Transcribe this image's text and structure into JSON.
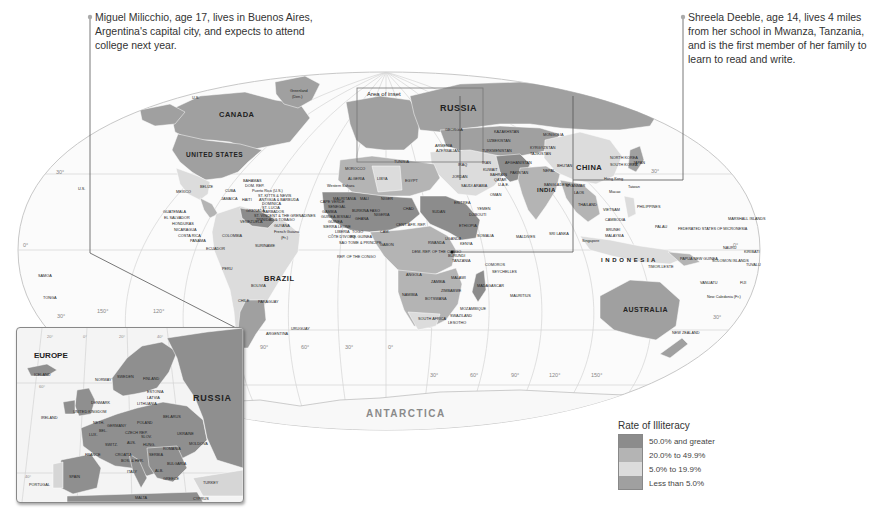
{
  "callouts": [
    {
      "id": "miguel",
      "text_lines": [
        "Miguel Milicchio, age 17, lives in Buenos Aires,",
        "Argentina's capital city, and expects to attend",
        "college next year."
      ]
    },
    {
      "id": "shreela",
      "text_lines": [
        "Shreela Deeble, age 14, lives 4 miles",
        "from her school in Mwanza, Tanzania,",
        "and is the first member of her family to",
        "learn to read and write."
      ]
    }
  ],
  "legend": {
    "title": "Rate of Illiteracy",
    "items": [
      {
        "label": "50.0% and greater",
        "color": "#8c8c8c"
      },
      {
        "label": "20.0% to 49.9%",
        "color": "#b4b4b4"
      },
      {
        "label": "5.0% to 19.9%",
        "color": "#dcdcdc"
      },
      {
        "label": "Less than 5.0%",
        "color": "#a0a0a0"
      }
    ]
  },
  "inset": {
    "title": "EUROPE",
    "russia_label": "RUSSIA",
    "area_of_inset_label": "Area of inset",
    "countries": [
      "ICELAND",
      "NORWAY",
      "SWEDEN",
      "FINLAND",
      "ESTONIA",
      "LATVIA",
      "LITHUANIA",
      "DENMARK",
      "UNITED KINGDOM",
      "IRELAND",
      "NETH.",
      "BEL.",
      "LUX.",
      "GERMANY",
      "POLAND",
      "BELARUS",
      "UKRAINE",
      "MOLDOVA",
      "CZECH REP.",
      "SLOV.",
      "AUS.",
      "HUNG.",
      "ROMANIA",
      "SWITZ.",
      "FRANCE",
      "CROATIA",
      "BOS. & HER.",
      "SERBIA",
      "BULGARIA",
      "ALB.",
      "GREECE",
      "ITALY",
      "SPAIN",
      "PORTUGAL",
      "TURKEY",
      "MALTA",
      "CYPRUS"
    ],
    "grid_labels": [
      "20°",
      "0°",
      "20°",
      "40°",
      "60°",
      "40°"
    ]
  },
  "map": {
    "big_labels": {
      "russia": "RUSSIA",
      "canada": "CANADA",
      "us": "UNITED STATES",
      "brazil": "BRAZIL",
      "china": "CHINA",
      "india": "INDIA",
      "australia": "AUSTRALIA",
      "indonesia": "I N D O N E S I A",
      "antarctica": "ANTARCTICA"
    },
    "labels": [
      {
        "t": "Greenland",
        "x": 290,
        "y": 92
      },
      {
        "t": "(Den.)",
        "x": 292,
        "y": 98
      },
      {
        "t": "U.S.",
        "x": 192,
        "y": 99
      },
      {
        "t": "MEXICO",
        "x": 176,
        "y": 193
      },
      {
        "t": "BELIZE",
        "x": 200,
        "y": 188
      },
      {
        "t": "CUBA",
        "x": 225,
        "y": 192
      },
      {
        "t": "BAHAMAS",
        "x": 243,
        "y": 182
      },
      {
        "t": "DOM. REP.",
        "x": 245,
        "y": 187
      },
      {
        "t": "Puerto Rico (U.S.)",
        "x": 252,
        "y": 192
      },
      {
        "t": "ST. KITTS & NEVIS",
        "x": 258,
        "y": 197
      },
      {
        "t": "ANTIGUA & BARBUDA",
        "x": 259,
        "y": 201
      },
      {
        "t": "DOMINICA",
        "x": 262,
        "y": 205
      },
      {
        "t": "ST. LUCIA",
        "x": 262,
        "y": 209
      },
      {
        "t": "BARBADOS",
        "x": 263,
        "y": 213
      },
      {
        "t": "ST. VINCENT & THE GRENADINES",
        "x": 254,
        "y": 217
      },
      {
        "t": "TRINIDAD & TOBAGO",
        "x": 256,
        "y": 221
      },
      {
        "t": "GRENADA",
        "x": 246,
        "y": 212
      },
      {
        "t": "JAMAICA",
        "x": 221,
        "y": 200
      },
      {
        "t": "HAITI",
        "x": 242,
        "y": 201
      },
      {
        "t": "GUATEMALA",
        "x": 163,
        "y": 213
      },
      {
        "t": "EL SALVADOR",
        "x": 164,
        "y": 219
      },
      {
        "t": "HONDURAS",
        "x": 172,
        "y": 225
      },
      {
        "t": "NICARAGUA",
        "x": 174,
        "y": 231
      },
      {
        "t": "COSTA RICA",
        "x": 178,
        "y": 237
      },
      {
        "t": "PANAMA",
        "x": 190,
        "y": 242
      },
      {
        "t": "ECUADOR",
        "x": 206,
        "y": 250
      },
      {
        "t": "COLOMBIA",
        "x": 222,
        "y": 237
      },
      {
        "t": "VENEZUELA",
        "x": 240,
        "y": 223
      },
      {
        "t": "GUYANA",
        "x": 274,
        "y": 227
      },
      {
        "t": "SURINAME",
        "x": 255,
        "y": 247
      },
      {
        "t": "French Guiana",
        "x": 274,
        "y": 233
      },
      {
        "t": "(Fr.)",
        "x": 281,
        "y": 239
      },
      {
        "t": "PERU",
        "x": 222,
        "y": 270
      },
      {
        "t": "BOLIVIA",
        "x": 251,
        "y": 287
      },
      {
        "t": "CHILE",
        "x": 238,
        "y": 302
      },
      {
        "t": "PARAGUAY",
        "x": 258,
        "y": 303
      },
      {
        "t": "URUGUAY",
        "x": 291,
        "y": 330
      },
      {
        "t": "ARGENTINA",
        "x": 266,
        "y": 335
      },
      {
        "t": "MOROCCO",
        "x": 345,
        "y": 170
      },
      {
        "t": "ALGERIA",
        "x": 348,
        "y": 180
      },
      {
        "t": "LIBYA",
        "x": 377,
        "y": 180
      },
      {
        "t": "EGYPT",
        "x": 405,
        "y": 182
      },
      {
        "t": "Western Sahara",
        "x": 327,
        "y": 187
      },
      {
        "t": "MAURITANIA",
        "x": 333,
        "y": 200
      },
      {
        "t": "MALI",
        "x": 360,
        "y": 200
      },
      {
        "t": "NIGER",
        "x": 381,
        "y": 200
      },
      {
        "t": "CHAD",
        "x": 403,
        "y": 210
      },
      {
        "t": "SUDAN",
        "x": 432,
        "y": 213
      },
      {
        "t": "CAPE VERDE",
        "x": 320,
        "y": 203
      },
      {
        "t": "SENEGAL",
        "x": 328,
        "y": 208
      },
      {
        "t": "GAMBIA",
        "x": 322,
        "y": 213
      },
      {
        "t": "GUINEA-BISSAU",
        "x": 321,
        "y": 218
      },
      {
        "t": "GUINEA",
        "x": 328,
        "y": 223
      },
      {
        "t": "SIERRA LEONE",
        "x": 323,
        "y": 228
      },
      {
        "t": "LIBERIA",
        "x": 335,
        "y": 233
      },
      {
        "t": "CÔTE D'IVOIRE",
        "x": 328,
        "y": 238
      },
      {
        "t": "TOGO",
        "x": 352,
        "y": 233
      },
      {
        "t": "EQ. GUINEA",
        "x": 350,
        "y": 238
      },
      {
        "t": "SAO TOME & PRINCIPE",
        "x": 339,
        "y": 244
      },
      {
        "t": "REP. OF THE CONGO",
        "x": 337,
        "y": 258
      },
      {
        "t": "BURKINA FASO",
        "x": 352,
        "y": 212
      },
      {
        "t": "GHANA",
        "x": 355,
        "y": 220
      },
      {
        "t": "NIGERIA",
        "x": 374,
        "y": 216
      },
      {
        "t": "CAM.",
        "x": 380,
        "y": 233
      },
      {
        "t": "GABON",
        "x": 380,
        "y": 246
      },
      {
        "t": "CENT. AFR. REP.",
        "x": 396,
        "y": 226
      },
      {
        "t": "ETHIOPIA",
        "x": 459,
        "y": 227
      },
      {
        "t": "SOMALIA",
        "x": 477,
        "y": 237
      },
      {
        "t": "ERITREA",
        "x": 454,
        "y": 204
      },
      {
        "t": "YEMEN",
        "x": 477,
        "y": 210
      },
      {
        "t": "DJIBOUTI",
        "x": 469,
        "y": 216
      },
      {
        "t": "OMAN",
        "x": 490,
        "y": 196
      },
      {
        "t": "SAUDI ARABIA",
        "x": 461,
        "y": 187
      },
      {
        "t": "UGANDA",
        "x": 445,
        "y": 240
      },
      {
        "t": "KENYA",
        "x": 460,
        "y": 245
      },
      {
        "t": "RWANDA",
        "x": 428,
        "y": 244
      },
      {
        "t": "BURUNDI",
        "x": 448,
        "y": 257
      },
      {
        "t": "TANZANIA",
        "x": 452,
        "y": 262
      },
      {
        "t": "DEM. REP. OF THE CONGO",
        "x": 412,
        "y": 253
      },
      {
        "t": "ANGOLA",
        "x": 406,
        "y": 276
      },
      {
        "t": "ZAMBIA",
        "x": 431,
        "y": 283
      },
      {
        "t": "MALAWI",
        "x": 451,
        "y": 279
      },
      {
        "t": "NAMIBIA",
        "x": 402,
        "y": 296
      },
      {
        "t": "BOTSWANA",
        "x": 425,
        "y": 300
      },
      {
        "t": "ZIMBABWE",
        "x": 441,
        "y": 292
      },
      {
        "t": "MOZAMBIQUE",
        "x": 460,
        "y": 310
      },
      {
        "t": "SOUTH AFRICA",
        "x": 418,
        "y": 320
      },
      {
        "t": "SWAZILAND",
        "x": 450,
        "y": 317
      },
      {
        "t": "LESOTHO",
        "x": 448,
        "y": 324
      },
      {
        "t": "MADAGASCAR",
        "x": 477,
        "y": 287
      },
      {
        "t": "MAURITIUS",
        "x": 510,
        "y": 297
      },
      {
        "t": "COMOROS",
        "x": 485,
        "y": 266
      },
      {
        "t": "SEYCHELLES",
        "x": 492,
        "y": 273
      },
      {
        "t": "MALDIVES",
        "x": 516,
        "y": 238
      },
      {
        "t": "SRI LANKA",
        "x": 549,
        "y": 235
      },
      {
        "t": "TUNISIA",
        "x": 394,
        "y": 163
      },
      {
        "t": "GEORGIA",
        "x": 445,
        "y": 131
      },
      {
        "t": "ARMENIA",
        "x": 435,
        "y": 147
      },
      {
        "t": "AZERBAIJAN",
        "x": 436,
        "y": 152
      },
      {
        "t": "KAZAKHSTAN",
        "x": 494,
        "y": 133
      },
      {
        "t": "MONGOLIA",
        "x": 543,
        "y": 136
      },
      {
        "t": "UZBEKISTAN",
        "x": 487,
        "y": 142
      },
      {
        "t": "TURKMENISTAN",
        "x": 482,
        "y": 152
      },
      {
        "t": "KYRGYZSTAN",
        "x": 530,
        "y": 149
      },
      {
        "t": "TAJIKISTAN",
        "x": 530,
        "y": 155
      },
      {
        "t": "AFGHANISTAN",
        "x": 505,
        "y": 164
      },
      {
        "t": "PAKISTAN",
        "x": 510,
        "y": 174
      },
      {
        "t": "IRAN",
        "x": 482,
        "y": 164
      },
      {
        "t": "IRAQ",
        "x": 458,
        "y": 166
      },
      {
        "t": "KUWAIT",
        "x": 483,
        "y": 171
      },
      {
        "t": "JORDAN",
        "x": 452,
        "y": 178
      },
      {
        "t": "BAHRAIN",
        "x": 490,
        "y": 176
      },
      {
        "t": "QATAR",
        "x": 494,
        "y": 181
      },
      {
        "t": "U.A.E.",
        "x": 498,
        "y": 186
      },
      {
        "t": "NEPAL",
        "x": 543,
        "y": 172
      },
      {
        "t": "BHUTAN",
        "x": 557,
        "y": 167
      },
      {
        "t": "BANGLADESH",
        "x": 544,
        "y": 186
      },
      {
        "t": "MYANMAR",
        "x": 566,
        "y": 187
      },
      {
        "t": "LAOS",
        "x": 574,
        "y": 194
      },
      {
        "t": "THAILAND",
        "x": 578,
        "y": 206
      },
      {
        "t": "VIETNAM",
        "x": 603,
        "y": 211
      },
      {
        "t": "CAMBODIA",
        "x": 605,
        "y": 221
      },
      {
        "t": "PHILIPPINES",
        "x": 637,
        "y": 208
      },
      {
        "t": "BRUNEI",
        "x": 606,
        "y": 231
      },
      {
        "t": "MALAYSIA",
        "x": 605,
        "y": 237
      },
      {
        "t": "Singapore",
        "x": 582,
        "y": 242
      },
      {
        "t": "Hong Kong",
        "x": 604,
        "y": 180
      },
      {
        "t": "Macao",
        "x": 609,
        "y": 193
      },
      {
        "t": "Taiwan",
        "x": 628,
        "y": 188
      },
      {
        "t": "NORTH KOREA",
        "x": 610,
        "y": 159
      },
      {
        "t": "SOUTH KOREA",
        "x": 610,
        "y": 166
      },
      {
        "t": "JAPAN",
        "x": 633,
        "y": 164
      },
      {
        "t": "PALAU",
        "x": 655,
        "y": 228
      },
      {
        "t": "FEDERATED STATES OF MICRONESIA",
        "x": 678,
        "y": 230
      },
      {
        "t": "MARSHALL ISLANDS",
        "x": 728,
        "y": 220
      },
      {
        "t": "NAURU",
        "x": 723,
        "y": 249
      },
      {
        "t": "KIRIBATI",
        "x": 744,
        "y": 253
      },
      {
        "t": "TUVALU",
        "x": 746,
        "y": 266
      },
      {
        "t": "PAPUA NEW GUINEA",
        "x": 680,
        "y": 260
      },
      {
        "t": "SOLOMON ISLANDS",
        "x": 712,
        "y": 262
      },
      {
        "t": "TIMOR-LESTE",
        "x": 648,
        "y": 268
      },
      {
        "t": "VANUATU",
        "x": 700,
        "y": 284
      },
      {
        "t": "FIJI",
        "x": 740,
        "y": 284
      },
      {
        "t": "New Caledonia (Fr.)",
        "x": 707,
        "y": 298
      },
      {
        "t": "NEW ZEALAND",
        "x": 672,
        "y": 334
      },
      {
        "t": "SAMOA",
        "x": 38,
        "y": 277
      },
      {
        "t": "TONGA",
        "x": 43,
        "y": 299
      },
      {
        "t": "U.S.",
        "x": 78,
        "y": 190
      }
    ],
    "grid_labels": [
      {
        "t": "30°",
        "x": 56,
        "y": 174
      },
      {
        "t": "0°",
        "x": 23,
        "y": 247
      },
      {
        "t": "30°",
        "x": 57,
        "y": 318
      },
      {
        "t": "150°",
        "x": 97,
        "y": 313
      },
      {
        "t": "120°",
        "x": 153,
        "y": 313
      },
      {
        "t": "90°",
        "x": 260,
        "y": 349
      },
      {
        "t": "60°",
        "x": 301,
        "y": 349
      },
      {
        "t": "30°",
        "x": 345,
        "y": 349
      },
      {
        "t": "0°",
        "x": 388,
        "y": 349
      },
      {
        "t": "30°",
        "x": 430,
        "y": 377
      },
      {
        "t": "60°",
        "x": 470,
        "y": 377
      },
      {
        "t": "90°",
        "x": 511,
        "y": 377
      },
      {
        "t": "120°",
        "x": 549,
        "y": 377
      },
      {
        "t": "150°",
        "x": 591,
        "y": 377
      },
      {
        "t": "30°",
        "x": 651,
        "y": 173
      },
      {
        "t": "30°",
        "x": 713,
        "y": 319
      },
      {
        "t": "0°",
        "x": 733,
        "y": 247
      }
    ]
  }
}
